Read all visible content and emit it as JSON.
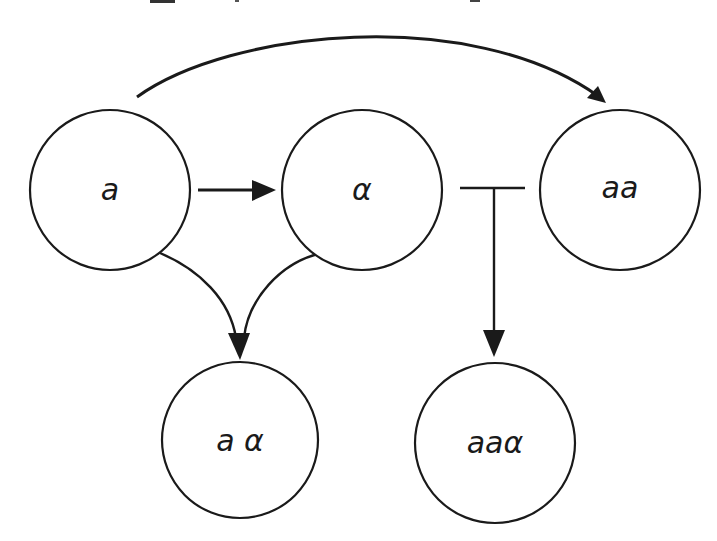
{
  "diagram": {
    "type": "regulatory-network",
    "colors": {
      "stroke": "#1a1a1a",
      "background": "#ffffff"
    },
    "nodes": [
      {
        "id": "a",
        "label": "a",
        "cx": 110,
        "cy": 190,
        "r": 80
      },
      {
        "id": "alpha",
        "label": "α",
        "cx": 362,
        "cy": 190,
        "r": 80
      },
      {
        "id": "aa",
        "label": "aa",
        "cx": 620,
        "cy": 190,
        "r": 80
      },
      {
        "id": "a_alpha",
        "label": "a α",
        "cx": 240,
        "cy": 440,
        "r": 78
      },
      {
        "id": "aa_alpha",
        "label": "aaα",
        "cx": 495,
        "cy": 443,
        "r": 80
      }
    ],
    "edges": [
      {
        "from": "a",
        "to": "aa",
        "kind": "activation",
        "shape": "arc-over-top"
      },
      {
        "from": "a",
        "to": "alpha",
        "kind": "activation",
        "shape": "straight"
      },
      {
        "from": "a",
        "to": "a_alpha",
        "kind": "activation",
        "shape": "converging-curve"
      },
      {
        "from": "alpha",
        "to": "a_alpha",
        "kind": "activation",
        "shape": "converging-curve"
      },
      {
        "from": "alpha",
        "to": "aa",
        "kind": "inhibition-bar",
        "shape": "T-junction"
      },
      {
        "from": "inhibition-bar",
        "to": "aa_alpha",
        "kind": "activation",
        "shape": "straight-down"
      }
    ]
  }
}
